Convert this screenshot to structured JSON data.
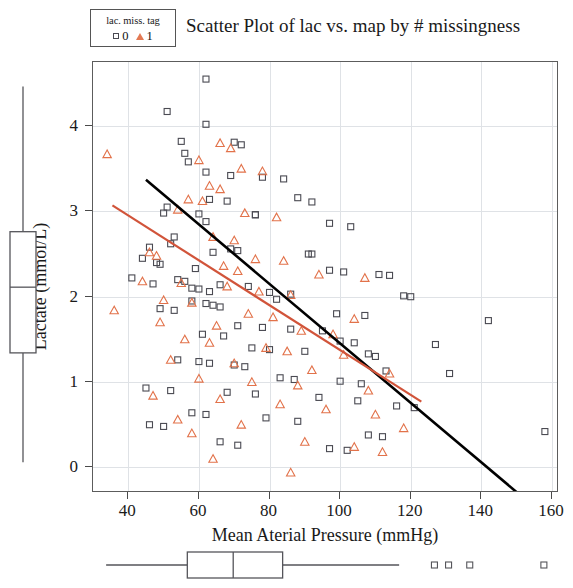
{
  "title": "Scatter Plot of lac vs. map by # missingness",
  "legend": {
    "title": "lac. miss. tag",
    "items": [
      {
        "label": "0",
        "marker": "square-marker",
        "color": "#4a4a52"
      },
      {
        "label": "1",
        "marker": "triangle-marker",
        "color": "#e2724a"
      }
    ]
  },
  "colors": {
    "group0": "#4a4a52",
    "group1": "#e2724a",
    "fit0_line": "#000000",
    "fit1_line": "#d1543a",
    "grid": "#dfe2e6",
    "frame": "#5c5c5c"
  },
  "chart_data": {
    "type": "scatter",
    "title": "Scatter Plot of lac vs. map by # missingness",
    "xlabel": "Mean Aterial Pressure (mmHg)",
    "ylabel": "Lactate (mmol/L)",
    "xlim": [
      30,
      162
    ],
    "ylim": [
      -0.3,
      4.75
    ],
    "xticks": [
      40,
      60,
      80,
      100,
      120,
      140,
      160
    ],
    "yticks": [
      0,
      1,
      2,
      3,
      4
    ],
    "grid": true,
    "legend_position": "top-left-outside",
    "legend_title": "lac. miss. tag",
    "series": [
      {
        "name": "0",
        "marker": "open-square",
        "color": "#4a4a52",
        "points": [
          [
            62,
            4.55
          ],
          [
            51,
            4.17
          ],
          [
            62,
            4.02
          ],
          [
            55,
            3.82
          ],
          [
            70,
            3.81
          ],
          [
            72,
            3.78
          ],
          [
            56,
            3.68
          ],
          [
            57,
            3.58
          ],
          [
            62,
            3.46
          ],
          [
            69,
            3.42
          ],
          [
            78,
            3.4
          ],
          [
            84,
            3.38
          ],
          [
            88,
            3.16
          ],
          [
            63,
            3.14
          ],
          [
            68,
            3.12
          ],
          [
            92,
            3.11
          ],
          [
            51,
            3.05
          ],
          [
            50,
            2.98
          ],
          [
            60,
            2.97
          ],
          [
            76,
            2.96
          ],
          [
            76,
            2.96
          ],
          [
            62,
            2.88
          ],
          [
            97,
            2.86
          ],
          [
            103,
            2.82
          ],
          [
            53,
            2.7
          ],
          [
            52,
            2.62
          ],
          [
            46,
            2.58
          ],
          [
            69,
            2.56
          ],
          [
            71,
            2.54
          ],
          [
            64,
            2.52
          ],
          [
            91,
            2.5
          ],
          [
            92,
            2.5
          ],
          [
            44,
            2.45
          ],
          [
            48,
            2.4
          ],
          [
            49,
            2.38
          ],
          [
            59,
            2.33
          ],
          [
            97,
            2.31
          ],
          [
            101,
            2.29
          ],
          [
            111,
            2.26
          ],
          [
            114,
            2.25
          ],
          [
            41,
            2.22
          ],
          [
            54,
            2.2
          ],
          [
            56,
            2.18
          ],
          [
            47,
            2.15
          ],
          [
            66,
            2.14
          ],
          [
            74,
            2.12
          ],
          [
            58,
            2.1
          ],
          [
            60,
            2.09
          ],
          [
            63,
            2.06
          ],
          [
            80,
            2.05
          ],
          [
            86,
            2.03
          ],
          [
            118,
            2.01
          ],
          [
            120,
            2.0
          ],
          [
            82,
            1.97
          ],
          [
            58,
            1.95
          ],
          [
            62,
            1.92
          ],
          [
            64,
            1.9
          ],
          [
            66,
            1.88
          ],
          [
            49,
            1.86
          ],
          [
            53,
            1.84
          ],
          [
            99,
            1.8
          ],
          [
            107,
            1.78
          ],
          [
            142,
            1.72
          ],
          [
            71,
            1.66
          ],
          [
            78,
            1.64
          ],
          [
            86,
            1.62
          ],
          [
            95,
            1.6
          ],
          [
            61,
            1.56
          ],
          [
            67,
            1.54
          ],
          [
            100,
            1.48
          ],
          [
            104,
            1.46
          ],
          [
            127,
            1.44
          ],
          [
            75,
            1.4
          ],
          [
            80,
            1.38
          ],
          [
            90,
            1.36
          ],
          [
            108,
            1.33
          ],
          [
            110,
            1.3
          ],
          [
            54,
            1.26
          ],
          [
            60,
            1.24
          ],
          [
            63,
            1.22
          ],
          [
            70,
            1.2
          ],
          [
            73,
            1.18
          ],
          [
            113,
            1.13
          ],
          [
            131,
            1.1
          ],
          [
            83,
            1.05
          ],
          [
            87,
            1.03
          ],
          [
            100,
            1.01
          ],
          [
            106,
            0.98
          ],
          [
            45,
            0.93
          ],
          [
            52,
            0.9
          ],
          [
            68,
            0.88
          ],
          [
            76,
            0.86
          ],
          [
            94,
            0.82
          ],
          [
            105,
            0.78
          ],
          [
            116,
            0.72
          ],
          [
            121,
            0.7
          ],
          [
            58,
            0.64
          ],
          [
            62,
            0.62
          ],
          [
            79,
            0.58
          ],
          [
            88,
            0.54
          ],
          [
            46,
            0.5
          ],
          [
            50,
            0.48
          ],
          [
            158,
            0.42
          ],
          [
            108,
            0.38
          ],
          [
            112,
            0.36
          ],
          [
            66,
            0.3
          ],
          [
            71,
            0.26
          ],
          [
            97,
            0.22
          ],
          [
            102,
            0.2
          ]
        ]
      },
      {
        "name": "1",
        "marker": "open-triangle",
        "color": "#e2724a",
        "points": [
          [
            34,
            3.67
          ],
          [
            66,
            3.8
          ],
          [
            69,
            3.74
          ],
          [
            60,
            3.6
          ],
          [
            72,
            3.5
          ],
          [
            78,
            3.47
          ],
          [
            63,
            3.3
          ],
          [
            66,
            3.26
          ],
          [
            57,
            3.14
          ],
          [
            61,
            3.12
          ],
          [
            54,
            3.02
          ],
          [
            73,
            2.98
          ],
          [
            82,
            2.93
          ],
          [
            64,
            2.7
          ],
          [
            70,
            2.66
          ],
          [
            46,
            2.52
          ],
          [
            48,
            2.48
          ],
          [
            76,
            2.44
          ],
          [
            84,
            2.42
          ],
          [
            67,
            2.36
          ],
          [
            71,
            2.3
          ],
          [
            94,
            2.26
          ],
          [
            107,
            2.22
          ],
          [
            44,
            2.18
          ],
          [
            55,
            2.16
          ],
          [
            68,
            2.12
          ],
          [
            77,
            2.06
          ],
          [
            86,
            2.02
          ],
          [
            50,
            1.96
          ],
          [
            58,
            1.93
          ],
          [
            36,
            1.84
          ],
          [
            74,
            1.8
          ],
          [
            81,
            1.76
          ],
          [
            104,
            1.74
          ],
          [
            49,
            1.7
          ],
          [
            65,
            1.66
          ],
          [
            89,
            1.6
          ],
          [
            98,
            1.56
          ],
          [
            56,
            1.5
          ],
          [
            63,
            1.46
          ],
          [
            79,
            1.4
          ],
          [
            85,
            1.36
          ],
          [
            101,
            1.32
          ],
          [
            52,
            1.26
          ],
          [
            70,
            1.22
          ],
          [
            92,
            1.14
          ],
          [
            114,
            1.1
          ],
          [
            60,
            1.04
          ],
          [
            75,
            1.0
          ],
          [
            88,
            0.96
          ],
          [
            108,
            0.9
          ],
          [
            47,
            0.84
          ],
          [
            66,
            0.8
          ],
          [
            83,
            0.74
          ],
          [
            96,
            0.68
          ],
          [
            110,
            0.62
          ],
          [
            54,
            0.56
          ],
          [
            72,
            0.5
          ],
          [
            118,
            0.46
          ],
          [
            58,
            0.4
          ],
          [
            90,
            0.3
          ],
          [
            104,
            0.24
          ],
          [
            112,
            0.18
          ],
          [
            64,
            0.1
          ],
          [
            86,
            -0.06
          ]
        ]
      }
    ],
    "fit_lines": [
      {
        "name": "fit-group-0",
        "color": "#000000",
        "x0": 45,
        "y0": 3.37,
        "x1": 150,
        "y1": -0.29
      },
      {
        "name": "fit-group-1",
        "color": "#d1543a",
        "x0": 35.5,
        "y0": 3.07,
        "x1": 123,
        "y1": 0.77
      }
    ],
    "marginal_boxplot_y": {
      "variable": "Lactate (mmol/L)",
      "min": 0.05,
      "q1": 1.33,
      "median": 2.1,
      "q3": 2.75,
      "max": 4.45
    },
    "marginal_boxplot_x": {
      "variable": "Mean Aterial Pressure (mmHg)",
      "min": 34,
      "q1": 57,
      "median": 70,
      "q3": 84,
      "max": 117,
      "outliers": [
        127,
        131,
        137,
        158
      ]
    }
  },
  "axes": {
    "x": {
      "title": "Mean Aterial Pressure (mmHg)",
      "ticks": [
        "40",
        "60",
        "80",
        "100",
        "120",
        "140",
        "160"
      ]
    },
    "y": {
      "title": "Lactate (mmol/L)",
      "ticks": [
        "0",
        "1",
        "2",
        "3",
        "4"
      ]
    }
  }
}
